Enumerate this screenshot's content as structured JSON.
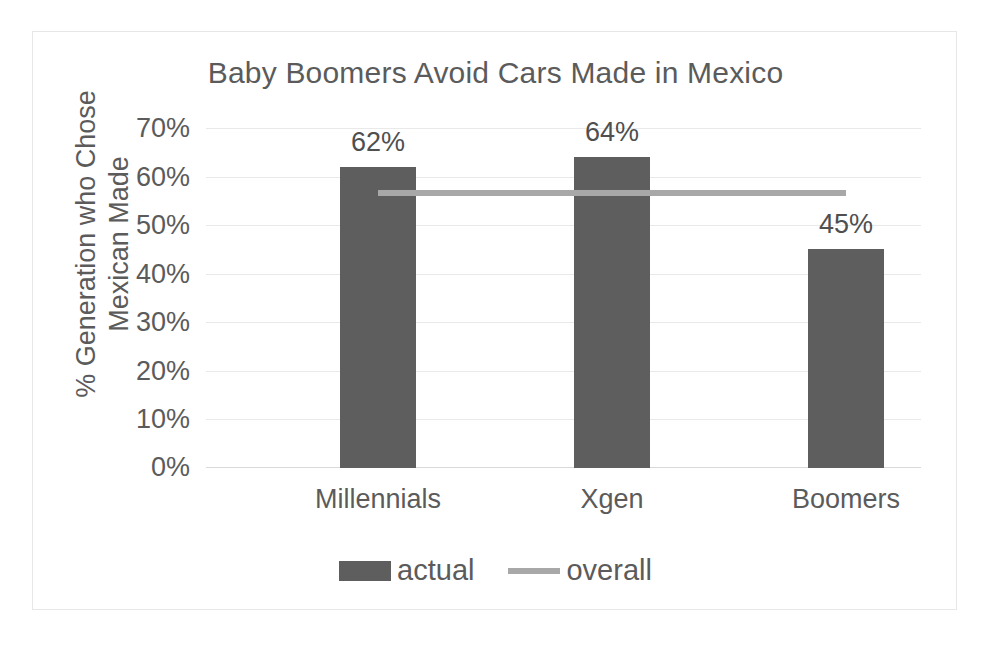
{
  "chart_data": {
    "type": "bar",
    "title": "Baby Boomers Avoid Cars Made in Mexico",
    "xlabel": "",
    "ylabel_lines": [
      "% Generation who Chose",
      "Mexican Made"
    ],
    "ylabel": "% Generation who Chose Mexican Made",
    "categories": [
      "Millennials",
      "Xgen",
      "Boomers"
    ],
    "ylim": [
      0,
      70
    ],
    "ytick_values": [
      70,
      60,
      50,
      40,
      30,
      20,
      10,
      0
    ],
    "ytick_labels": [
      "70%",
      "60%",
      "50%",
      "40%",
      "30%",
      "20%",
      "10%",
      "0%"
    ],
    "grid": true,
    "legend_position": "bottom",
    "series": [
      {
        "name": "actual",
        "type": "bar",
        "color": "#5e5e5e",
        "values": [
          62,
          64,
          45
        ],
        "data_labels": [
          "62%",
          "64%",
          "45%"
        ]
      },
      {
        "name": "overall",
        "type": "line",
        "color": "#a8a8a8",
        "values": [
          56,
          56,
          56
        ],
        "data_labels": []
      }
    ]
  },
  "legend": {
    "items": [
      {
        "label": "actual",
        "marker": "bar-swatch",
        "color": "#5e5e5e"
      },
      {
        "label": "overall",
        "marker": "line-swatch",
        "color": "#a8a8a8"
      }
    ]
  },
  "colors": {
    "bar": "#5e5e5e",
    "line": "#a8a8a8",
    "text": "#5b5b5b",
    "gridline": "#e9e9e9",
    "frame_border": "#e7e7e7",
    "background": "#ffffff"
  }
}
